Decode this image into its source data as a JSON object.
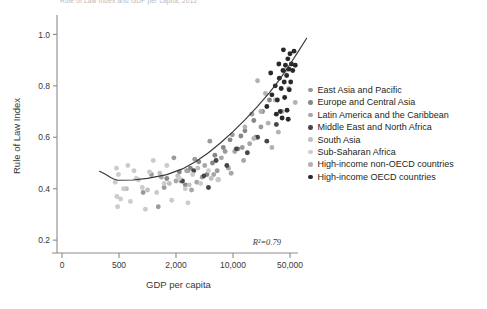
{
  "cut_title": "Rule of Law Index and GDP per capita, 2012",
  "chart_data": {
    "type": "scatter",
    "title": "",
    "xlabel": "GDP per capita",
    "ylabel": "Rule of Law Index",
    "xscale": "log",
    "xticks": [
      "0",
      "500",
      "2,000",
      "10,000",
      "50,000"
    ],
    "xtick_values": [
      0,
      500,
      2000,
      10000,
      50000
    ],
    "yticks": [
      "0.2",
      "0.4",
      "0.6",
      "0.8",
      "1.0"
    ],
    "ytick_values": [
      0.2,
      0.4,
      0.6,
      0.8,
      1.0
    ],
    "ylim": [
      0.15,
      1.06
    ],
    "grid": false,
    "annotation": "R²=0.79",
    "r_squared": 0.79,
    "legend_position": "right",
    "trendline": {
      "label": "fitted curve",
      "color": "#3a3637",
      "points": [
        [
          60,
          0.468
        ],
        [
          120,
          0.455
        ],
        [
          200,
          0.444
        ],
        [
          300,
          0.437
        ],
        [
          450,
          0.433
        ],
        [
          700,
          0.434
        ],
        [
          1000,
          0.44
        ],
        [
          1600,
          0.455
        ],
        [
          2400,
          0.477
        ],
        [
          3500,
          0.506
        ],
        [
          5000,
          0.54
        ],
        [
          7000,
          0.578
        ],
        [
          10000,
          0.622
        ],
        [
          14000,
          0.668
        ],
        [
          20000,
          0.72
        ],
        [
          28000,
          0.774
        ],
        [
          38000,
          0.828
        ],
        [
          50000,
          0.884
        ],
        [
          65000,
          0.94
        ],
        [
          80000,
          0.985
        ]
      ]
    },
    "series": [
      {
        "name": "East Asia and Pacific",
        "color": "#9d9a9b",
        "points": [
          [
            900,
            0.385
          ],
          [
            1100,
            0.455
          ],
          [
            1500,
            0.405
          ],
          [
            1900,
            0.52
          ],
          [
            2300,
            0.43
          ],
          [
            2800,
            0.47
          ],
          [
            3400,
            0.515
          ],
          [
            4200,
            0.445
          ],
          [
            5200,
            0.585
          ],
          [
            6400,
            0.47
          ],
          [
            8000,
            0.545
          ],
          [
            9800,
            0.61
          ],
          [
            13000,
            0.56
          ],
          [
            17000,
            0.69
          ],
          [
            22000,
            0.64
          ],
          [
            1300,
            0.33
          ]
        ]
      },
      {
        "name": "Europe and Central Asia",
        "color": "#8a8788",
        "points": [
          [
            1600,
            0.44
          ],
          [
            2200,
            0.465
          ],
          [
            3000,
            0.48
          ],
          [
            3800,
            0.505
          ],
          [
            4800,
            0.455
          ],
          [
            6000,
            0.53
          ],
          [
            7600,
            0.56
          ],
          [
            9200,
            0.59
          ],
          [
            11500,
            0.555
          ],
          [
            14000,
            0.625
          ],
          [
            18000,
            0.665
          ],
          [
            23000,
            0.7
          ],
          [
            28000,
            0.745
          ],
          [
            2600,
            0.415
          ],
          [
            5600,
            0.5
          ],
          [
            12500,
            0.605
          ]
        ]
      },
      {
        "name": "Latin America and the Caribbean",
        "color": "#a8a5a6",
        "points": [
          [
            1400,
            0.445
          ],
          [
            2000,
            0.43
          ],
          [
            2700,
            0.47
          ],
          [
            3600,
            0.425
          ],
          [
            4500,
            0.49
          ],
          [
            5800,
            0.455
          ],
          [
            7200,
            0.52
          ],
          [
            8800,
            0.48
          ],
          [
            10500,
            0.545
          ],
          [
            13500,
            0.51
          ],
          [
            16000,
            0.575
          ],
          [
            6600,
            0.435
          ],
          [
            3100,
            0.395
          ],
          [
            9500,
            0.46
          ],
          [
            19000,
            0.6
          ]
        ]
      },
      {
        "name": "Middle East and North Africa",
        "color": "#4a4647",
        "points": [
          [
            2400,
            0.43
          ],
          [
            3300,
            0.47
          ],
          [
            4400,
            0.45
          ],
          [
            6200,
            0.51
          ],
          [
            8400,
            0.49
          ],
          [
            11000,
            0.555
          ],
          [
            15000,
            0.54
          ],
          [
            20000,
            0.6
          ],
          [
            26000,
            0.585
          ],
          [
            34000,
            0.65
          ],
          [
            5000,
            0.405
          ]
        ]
      },
      {
        "name": "South Asia",
        "color": "#c2bfc0",
        "points": [
          [
            600,
            0.4
          ],
          [
            800,
            0.435
          ],
          [
            1000,
            0.395
          ],
          [
            1350,
            0.46
          ],
          [
            1700,
            0.42
          ],
          [
            2100,
            0.45
          ],
          [
            2900,
            0.415
          ],
          [
            3700,
            0.48
          ],
          [
            5400,
            0.44
          ]
        ]
      },
      {
        "name": "Sub-Saharan Africa",
        "color": "#cdcacb",
        "points": [
          [
            330,
            0.425
          ],
          [
            400,
            0.37
          ],
          [
            470,
            0.455
          ],
          [
            560,
            0.4
          ],
          [
            660,
            0.35
          ],
          [
            760,
            0.44
          ],
          [
            880,
            0.405
          ],
          [
            1050,
            0.465
          ],
          [
            1250,
            0.385
          ],
          [
            1500,
            0.42
          ],
          [
            1800,
            0.355
          ],
          [
            2200,
            0.44
          ],
          [
            2600,
            0.4
          ],
          [
            3200,
            0.455
          ],
          [
            4000,
            0.42
          ],
          [
            5000,
            0.47
          ],
          [
            6500,
            0.435
          ],
          [
            430,
            0.33
          ],
          [
            620,
            0.49
          ],
          [
            950,
            0.32
          ],
          [
            1150,
            0.51
          ],
          [
            380,
            0.48
          ],
          [
            520,
            0.36
          ],
          [
            720,
            0.47
          ],
          [
            1600,
            0.49
          ],
          [
            2800,
            0.345
          ]
        ]
      },
      {
        "name": "High-income non-OECD countries",
        "color": "#b4b1b2",
        "points": [
          [
            14000,
            0.64
          ],
          [
            18000,
            0.595
          ],
          [
            22000,
            0.7
          ],
          [
            27000,
            0.655
          ],
          [
            33000,
            0.745
          ],
          [
            40000,
            0.7
          ],
          [
            48000,
            0.79
          ],
          [
            58000,
            0.735
          ],
          [
            25000,
            0.77
          ],
          [
            36000,
            0.62
          ],
          [
            20000,
            0.82
          ],
          [
            30000,
            0.56
          ],
          [
            44000,
            0.86
          ]
        ]
      },
      {
        "name": "High-income OECD countries",
        "color": "#2b2829",
        "points": [
          [
            26000,
            0.72
          ],
          [
            30000,
            0.765
          ],
          [
            33000,
            0.8
          ],
          [
            35000,
            0.745
          ],
          [
            37000,
            0.83
          ],
          [
            39000,
            0.79
          ],
          [
            41000,
            0.86
          ],
          [
            42500,
            0.815
          ],
          [
            44000,
            0.88
          ],
          [
            45500,
            0.84
          ],
          [
            47000,
            0.905
          ],
          [
            48500,
            0.865
          ],
          [
            50000,
            0.925
          ],
          [
            52000,
            0.885
          ],
          [
            54000,
            0.86
          ],
          [
            56000,
            0.935
          ],
          [
            43000,
            0.755
          ],
          [
            46000,
            0.705
          ],
          [
            38000,
            0.7
          ],
          [
            34000,
            0.69
          ],
          [
            49000,
            0.785
          ],
          [
            41500,
            0.94
          ],
          [
            51000,
            0.815
          ],
          [
            29000,
            0.85
          ],
          [
            58000,
            0.88
          ],
          [
            36500,
            0.885
          ],
          [
            40000,
            0.675
          ],
          [
            47500,
            0.67
          ]
        ]
      }
    ]
  }
}
